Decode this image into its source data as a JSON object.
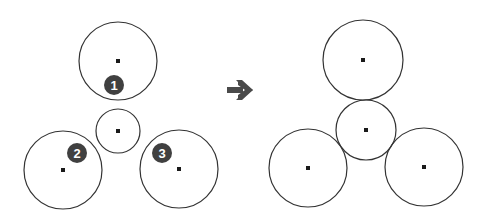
{
  "colors": {
    "stroke": "#333333",
    "center_dot": "#1a1a1a",
    "badge_fill": "#404040",
    "badge_text": "#ffffff",
    "arrow": "#4a4a4a",
    "background": "#ffffff"
  },
  "before": {
    "circles": [
      {
        "id": "top",
        "cx": 118,
        "cy": 61,
        "r": 39
      },
      {
        "id": "center",
        "cx": 118,
        "cy": 131,
        "r": 22
      },
      {
        "id": "bottom-left",
        "cx": 63,
        "cy": 170,
        "r": 39
      },
      {
        "id": "bottom-right",
        "cx": 179,
        "cy": 169,
        "r": 39
      }
    ],
    "badges": [
      {
        "label": "1",
        "cx": 114,
        "cy": 85
      },
      {
        "label": "2",
        "cx": 77,
        "cy": 153
      },
      {
        "label": "3",
        "cx": 162,
        "cy": 153
      }
    ]
  },
  "arrow": {
    "label": "right-arrow",
    "x1": 227,
    "x2": 253,
    "cy": 90
  },
  "after": {
    "circles": [
      {
        "id": "top",
        "cx": 363,
        "cy": 60,
        "r": 40
      },
      {
        "id": "center",
        "cx": 366,
        "cy": 130,
        "r": 30
      },
      {
        "id": "bottom-left",
        "cx": 308,
        "cy": 168,
        "r": 39
      },
      {
        "id": "bottom-right",
        "cx": 424,
        "cy": 167,
        "r": 39
      }
    ]
  }
}
